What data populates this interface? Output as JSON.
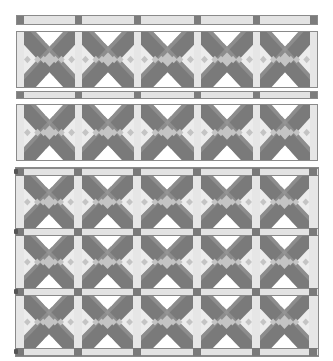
{
  "palette": {
    "dark": "#7a7a7a",
    "medium": "#9a9a9a",
    "light": "#c4c4c4",
    "pale": "#ececec",
    "white": "#ffffff",
    "outline": "#8a8a8a"
  },
  "layout": {
    "columns": 5,
    "sections": [
      {
        "type": "sashing-strip",
        "label": "Top sashing strip"
      },
      {
        "type": "block-row",
        "label": "Block row 1",
        "blocks": 5
      },
      {
        "type": "sashing-strip",
        "label": "Middle sashing strip"
      },
      {
        "type": "block-row",
        "label": "Block row 2",
        "blocks": 5
      },
      {
        "type": "sashed-grid",
        "label": "Sashed block grid",
        "rows": 3,
        "blocks_per_row": 5
      }
    ]
  },
  "block_pattern": "X cross block"
}
